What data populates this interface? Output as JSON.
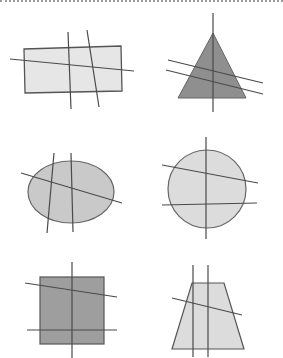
{
  "figure": {
    "colors": {
      "outline": "#555555",
      "line": "#4a4a4a",
      "light_fill": "#e6e6e6",
      "mid_fill": "#c9c9c9",
      "dark_fill": "#8f8f8f",
      "square_fill": "#9e9e9e",
      "border": "#9a9a9a"
    },
    "shapes": [
      {
        "name": "rectangle",
        "fill": "light_fill",
        "line_count": 3
      },
      {
        "name": "triangle",
        "fill": "dark_fill",
        "line_count": 3
      },
      {
        "name": "ellipse",
        "fill": "mid_fill",
        "line_count": 3
      },
      {
        "name": "circle",
        "fill": "light_fill",
        "line_count": 3
      },
      {
        "name": "square",
        "fill": "square_fill",
        "line_count": 3
      },
      {
        "name": "trapezoid",
        "fill": "light_fill",
        "line_count": 3
      }
    ]
  }
}
